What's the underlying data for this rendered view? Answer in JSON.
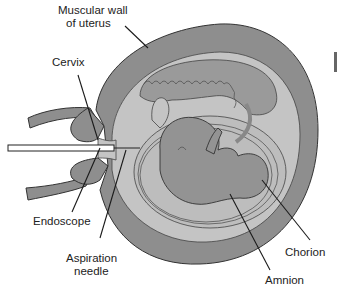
{
  "diagram": {
    "labels": {
      "muscular_wall_line1": "Muscular wall",
      "muscular_wall_line2": "of uterus",
      "cervix": "Cervix",
      "endoscope": "Endoscope",
      "aspiration_needle_line1": "Aspiration",
      "aspiration_needle_line2": "needle",
      "chorion": "Chorion",
      "amnion": "Amnion"
    },
    "colors": {
      "uterine_wall": "#8e8e8e",
      "chorion_layer": "#c4c4c4",
      "placenta": "#9a9a9a",
      "amniotic_fluid": "#bdbdbd",
      "fetus": "#939393",
      "outline": "#333333",
      "background": "#ffffff"
    }
  }
}
